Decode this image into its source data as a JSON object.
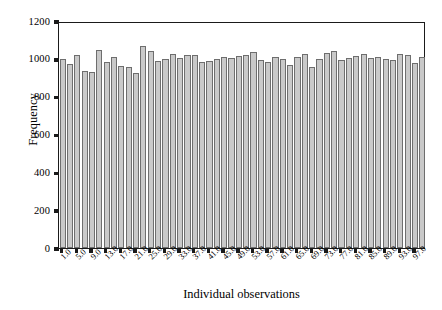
{
  "chart_data": {
    "type": "bar",
    "title": "",
    "subtitle": "",
    "xlabel": "Individual observations",
    "ylabel": "Frequency",
    "ylim": [
      0,
      1200
    ],
    "yticks": [
      0,
      200,
      400,
      600,
      800,
      1000,
      1200
    ],
    "ytick_labels": [
      "0",
      "200",
      "400",
      "600",
      "800",
      "1000",
      "1200"
    ],
    "grid": false,
    "legend": null,
    "legend_position": "none",
    "bar_color": "#c9c9c9",
    "bar_edge_color": "#6e6e6e",
    "axis_color": "#1a1a1a",
    "xtick_labels": [
      "1.0",
      "5.0",
      "9.0",
      "13.0",
      "17.0",
      "21.0",
      "25.0",
      "29.0",
      "33.0",
      "37.0",
      "41.0",
      "45.0",
      "49.0",
      "53.0",
      "57.0",
      "61.0",
      "65.0",
      "69.0",
      "73.0",
      "77.0",
      "81.0",
      "85.0",
      "89.0",
      "93.0",
      "97.0"
    ],
    "xtick_values": [
      1,
      5,
      9,
      13,
      17,
      21,
      25,
      29,
      33,
      37,
      41,
      45,
      49,
      53,
      57,
      61,
      65,
      69,
      73,
      77,
      81,
      85,
      89,
      93,
      97
    ],
    "categories": [
      "1",
      "3",
      "5",
      "7",
      "9",
      "11",
      "13",
      "15",
      "17",
      "19",
      "21",
      "23",
      "25",
      "27",
      "29",
      "31",
      "33",
      "35",
      "37",
      "39",
      "41",
      "43",
      "45",
      "47",
      "49",
      "51",
      "53",
      "55",
      "57",
      "59",
      "61",
      "63",
      "65",
      "67",
      "69",
      "71",
      "73",
      "75",
      "77",
      "79",
      "81",
      "83",
      "85",
      "87",
      "89",
      "91",
      "93",
      "95",
      "97",
      "99"
    ],
    "values": [
      998,
      975,
      1022,
      938,
      932,
      1048,
      981,
      1012,
      962,
      956,
      925,
      1068,
      1043,
      988,
      1000,
      1025,
      1006,
      1020,
      1019,
      982,
      986,
      1000,
      1009,
      1004,
      1016,
      1022,
      1038,
      995,
      985,
      1010,
      1000,
      968,
      1011,
      1024,
      958,
      998,
      1033,
      1040,
      996,
      1006,
      1014,
      1025,
      1002,
      1008,
      1000,
      994,
      1026,
      1018,
      978,
      1010
    ]
  }
}
